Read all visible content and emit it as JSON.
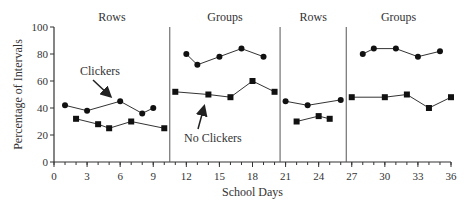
{
  "chart_data": {
    "type": "line",
    "title": "",
    "xlabel": "School Days",
    "ylabel": "Percentage of Intervals",
    "xlim": [
      0,
      36
    ],
    "ylim": [
      0,
      100
    ],
    "x_ticks": [
      0,
      3,
      6,
      9,
      12,
      15,
      18,
      21,
      24,
      27,
      30,
      33,
      36
    ],
    "y_ticks": [
      0,
      20,
      40,
      60,
      80,
      100
    ],
    "grid": false,
    "phases": [
      {
        "label": "Rows",
        "start": 0,
        "end": 10.5
      },
      {
        "label": "Groups",
        "start": 10.5,
        "end": 20.5
      },
      {
        "label": "Rows",
        "start": 20.5,
        "end": 26.5
      },
      {
        "label": "Groups",
        "start": 26.5,
        "end": 36
      }
    ],
    "phase_lines": [
      10.5,
      20.5,
      26.5
    ],
    "series": [
      {
        "name": "Clickers",
        "marker": "circle",
        "segments": [
          [
            [
              1,
              42
            ],
            [
              3,
              38
            ],
            [
              6,
              45
            ],
            [
              8,
              36
            ],
            [
              9,
              40
            ]
          ],
          [
            [
              12,
              80
            ],
            [
              13,
              72
            ],
            [
              15,
              78
            ],
            [
              17,
              84
            ],
            [
              19,
              78
            ]
          ],
          [
            [
              21,
              45
            ],
            [
              23,
              42
            ],
            [
              26,
              46
            ]
          ],
          [
            [
              28,
              80
            ],
            [
              29,
              84
            ],
            [
              31,
              84
            ],
            [
              33,
              78
            ],
            [
              35,
              82
            ]
          ]
        ]
      },
      {
        "name": "No Clickers",
        "marker": "square",
        "segments": [
          [
            [
              2,
              32
            ],
            [
              4,
              28
            ],
            [
              5,
              25
            ],
            [
              7,
              30
            ],
            [
              10,
              25
            ]
          ],
          [
            [
              11,
              52
            ],
            [
              14,
              50
            ],
            [
              16,
              48
            ],
            [
              18,
              60
            ],
            [
              20,
              52
            ]
          ],
          [
            [
              22,
              30
            ],
            [
              24,
              34
            ],
            [
              25,
              32
            ]
          ],
          [
            [
              27,
              48
            ],
            [
              30,
              48
            ],
            [
              32,
              50
            ],
            [
              34,
              40
            ],
            [
              36,
              48
            ]
          ]
        ]
      }
    ],
    "annotations": [
      {
        "text": "Clickers",
        "text_at": [
          8,
          92
        ],
        "arrow_to": [
          6,
          90
        ]
      },
      {
        "text": "No Clickers",
        "text_at": [
          18,
          190
        ],
        "arrow_to": [
          13.8,
          97
        ]
      }
    ]
  },
  "colors": {
    "line": "#333333",
    "axis": "#333333",
    "phase_line": "#555555"
  }
}
